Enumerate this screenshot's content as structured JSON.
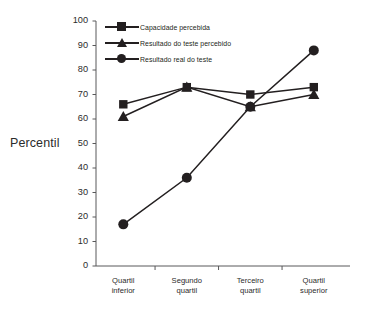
{
  "chart_data": {
    "type": "line",
    "title": "",
    "xlabel": "",
    "ylabel": "Percentil",
    "ylim": [
      0,
      100
    ],
    "yticks": [
      0,
      10,
      20,
      30,
      40,
      50,
      60,
      70,
      80,
      90,
      100
    ],
    "ytick_labels": [
      "0",
      "10",
      "20",
      "30",
      "40",
      "50",
      "60",
      "70",
      "80",
      "90",
      "100"
    ],
    "grid": false,
    "legend_position": "top-left-inside",
    "marker_color": "#231f20",
    "line_color": "#231f20",
    "categories": [
      "Quartil inferior",
      "Segundo quartil",
      "Terceiro quartil",
      "Quartil superior"
    ],
    "category_lines": [
      [
        "Quartil",
        "inferior"
      ],
      [
        "Segundo",
        "quartil"
      ],
      [
        "Terceiro",
        "quartil"
      ],
      [
        "Quartil",
        "superior"
      ]
    ],
    "series": [
      {
        "name": "Capacidade percebida",
        "marker": "square",
        "values": [
          66,
          73,
          70,
          73
        ]
      },
      {
        "name": "Resultado do teste percebido",
        "marker": "triangle",
        "values": [
          61,
          73,
          65,
          70
        ]
      },
      {
        "name": "Resultado real do teste",
        "marker": "circle",
        "values": [
          17,
          36,
          65,
          88
        ]
      }
    ]
  }
}
